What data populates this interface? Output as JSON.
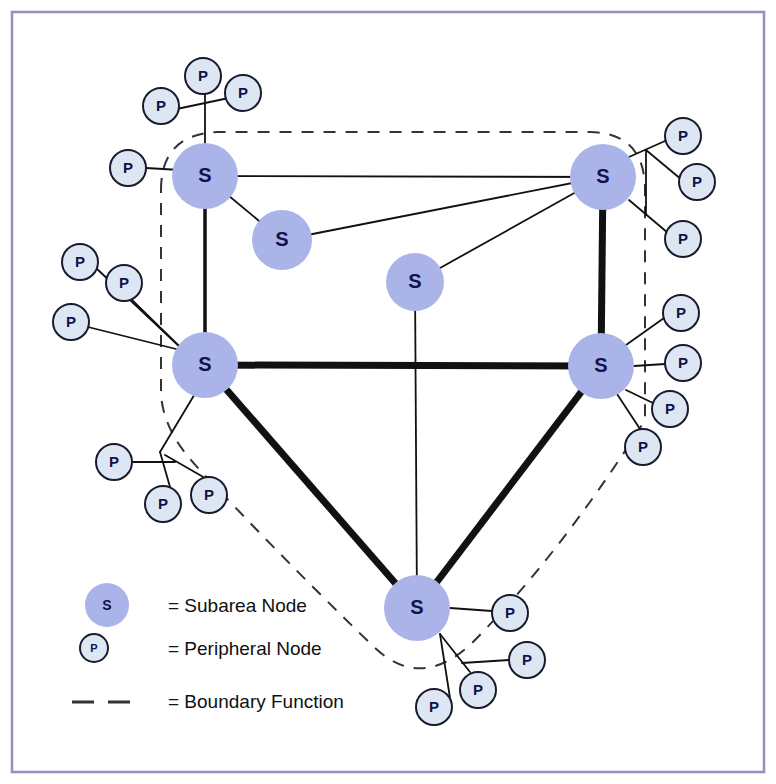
{
  "figure": {
    "kind": "network-topology-diagram",
    "background": "#ffffff",
    "frame": {
      "x": 12,
      "y": 12,
      "width": 752,
      "height": 760,
      "color": "#8f90c8",
      "stroke_width": 2.5
    }
  },
  "style": {
    "subarea_fill": "#aab4e8",
    "subarea_stroke": "none",
    "peripheral_fill": "#dde7f4",
    "peripheral_stroke": "#1a1a2e",
    "peripheral_stroke_width": 2,
    "backbone_link_color": "#111111",
    "backbone_link_width": 7,
    "trunk_link_color": "#111111",
    "trunk_link_width": 3.5,
    "thin_link_color": "#111111",
    "thin_link_width": 1.8,
    "boundary_color": "#333333",
    "boundary_width": 2,
    "boundary_dash": "12 10",
    "subarea_label_size": 20,
    "peripheral_label_size": 15
  },
  "subarea_nodes": [
    {
      "id": "s-top-left",
      "label": "S",
      "x": 205,
      "y": 176,
      "r": 33
    },
    {
      "id": "s-top-right",
      "label": "S",
      "x": 603,
      "y": 177,
      "r": 33
    },
    {
      "id": "s-mid-left",
      "label": "S",
      "x": 205,
      "y": 365,
      "r": 33
    },
    {
      "id": "s-mid-right",
      "label": "S",
      "x": 601,
      "y": 366,
      "r": 33
    },
    {
      "id": "s-bottom",
      "label": "S",
      "x": 417,
      "y": 608,
      "r": 33
    },
    {
      "id": "s-inner-upper",
      "label": "S",
      "x": 282,
      "y": 240,
      "r": 30
    },
    {
      "id": "s-inner-center",
      "label": "S",
      "x": 415,
      "y": 282,
      "r": 29
    }
  ],
  "peripheral_nodes": [
    {
      "id": "p-tl-1",
      "label": "P",
      "x": 203,
      "y": 76,
      "r": 18
    },
    {
      "id": "p-tl-2",
      "label": "P",
      "x": 161,
      "y": 106,
      "r": 18
    },
    {
      "id": "p-tl-3",
      "label": "P",
      "x": 243,
      "y": 93,
      "r": 18
    },
    {
      "id": "p-tl-4",
      "label": "P",
      "x": 128,
      "y": 168,
      "r": 18
    },
    {
      "id": "p-ml-1",
      "label": "P",
      "x": 80,
      "y": 262,
      "r": 18
    },
    {
      "id": "p-ml-2",
      "label": "P",
      "x": 124,
      "y": 283,
      "r": 18
    },
    {
      "id": "p-ml-3",
      "label": "P",
      "x": 71,
      "y": 322,
      "r": 18
    },
    {
      "id": "p-bl-1",
      "label": "P",
      "x": 114,
      "y": 462,
      "r": 18
    },
    {
      "id": "p-bl-2",
      "label": "P",
      "x": 163,
      "y": 504,
      "r": 18
    },
    {
      "id": "p-bl-3",
      "label": "P",
      "x": 209,
      "y": 495,
      "r": 18
    },
    {
      "id": "p-tr-1",
      "label": "P",
      "x": 683,
      "y": 136,
      "r": 18
    },
    {
      "id": "p-tr-2",
      "label": "P",
      "x": 697,
      "y": 182,
      "r": 18
    },
    {
      "id": "p-tr-3",
      "label": "P",
      "x": 683,
      "y": 239,
      "r": 18
    },
    {
      "id": "p-mr-1",
      "label": "P",
      "x": 681,
      "y": 313,
      "r": 18
    },
    {
      "id": "p-mr-2",
      "label": "P",
      "x": 683,
      "y": 363,
      "r": 18
    },
    {
      "id": "p-mr-3",
      "label": "P",
      "x": 670,
      "y": 409,
      "r": 18
    },
    {
      "id": "p-mr-4",
      "label": "P",
      "x": 643,
      "y": 447,
      "r": 18
    },
    {
      "id": "p-b-1",
      "label": "P",
      "x": 510,
      "y": 613,
      "r": 18
    },
    {
      "id": "p-b-2",
      "label": "P",
      "x": 527,
      "y": 660,
      "r": 18
    },
    {
      "id": "p-b-3",
      "label": "P",
      "x": 478,
      "y": 690,
      "r": 18
    },
    {
      "id": "p-b-4",
      "label": "P",
      "x": 434,
      "y": 707,
      "r": 18
    }
  ],
  "backbone_links": [
    {
      "id": "bb-midleft-midright",
      "from": "s-mid-left",
      "to": "s-mid-right"
    },
    {
      "id": "bb-topright-midright",
      "from": "s-top-right",
      "to": "s-mid-right"
    },
    {
      "id": "bb-midleft-bottom",
      "from": "s-mid-left",
      "to": "s-bottom"
    },
    {
      "id": "bb-midright-bottom",
      "from": "s-mid-right",
      "to": "s-bottom"
    }
  ],
  "trunk_links": [
    {
      "id": "tr-topleft-midleft",
      "from": "s-top-left",
      "to": "s-mid-left"
    }
  ],
  "thin_links": [
    {
      "id": "tn-topleft-topright",
      "from": "s-top-left",
      "to": "s-top-right"
    },
    {
      "id": "tn-topleft-innerupper",
      "from": "s-top-left",
      "to": "s-inner-upper"
    },
    {
      "id": "tn-innerupper-topright",
      "from": "s-inner-upper",
      "to": "s-top-right"
    },
    {
      "id": "tn-innercenter-topright",
      "from": "s-inner-center",
      "to": "s-top-right"
    },
    {
      "id": "tn-innercenter-bottom",
      "from": "s-inner-center",
      "to": "s-bottom"
    }
  ],
  "peripheral_links": [
    {
      "id": "pl-tl-stem",
      "points": "205,146 205,88"
    },
    {
      "id": "pl-tl-cross",
      "points": "172,110 243,95"
    },
    {
      "id": "pl-tl-4",
      "points": "146,168 180,170"
    },
    {
      "id": "pl-ml-fan-a",
      "points": "96,268 180,347"
    },
    {
      "id": "pl-ml-fan-b",
      "points": "131,299 180,347"
    },
    {
      "id": "pl-ml-fan-c",
      "points": "88,327 180,350"
    },
    {
      "id": "pl-bl-stem",
      "points": "196,392 160,452"
    },
    {
      "id": "pl-bl-1",
      "points": "132,462 175,462"
    },
    {
      "id": "pl-bl-2",
      "points": "170,487 163,487"
    },
    {
      "id": "pl-bl-3",
      "points": "165,455 205,478"
    },
    {
      "id": "pl-bl-4",
      "points": "160,452 170,487"
    },
    {
      "id": "pl-tr-stem",
      "points": "629,157 665,141"
    },
    {
      "id": "pl-tr-a",
      "points": "646,150 682,180"
    },
    {
      "id": "pl-tr-b",
      "points": "646,150 646,215"
    },
    {
      "id": "pl-tr-c",
      "points": "629,200 668,233"
    },
    {
      "id": "pl-mr-a",
      "points": "626,345 664,318"
    },
    {
      "id": "pl-mr-b",
      "points": "634,366 665,364"
    },
    {
      "id": "pl-mr-c",
      "points": "626,390 655,404"
    },
    {
      "id": "pl-mr-d",
      "points": "617,394 640,429"
    },
    {
      "id": "pl-b-a",
      "points": "450,608 492,611"
    },
    {
      "id": "pl-b-b",
      "points": "440,634 470,672"
    },
    {
      "id": "pl-b-c",
      "points": "440,634 450,698"
    },
    {
      "id": "pl-b-d",
      "points": "462,663 509,660"
    }
  ],
  "boundary": {
    "id": "boundary-function-outline",
    "path": "M 161 190 Q 161 134 218 132 L 590 132 Q 645 133 645 190 L 645 420 Q 560 555 470 645 Q 420 690 375 648 Q 280 556 200 470 Q 161 430 161 390 Z"
  },
  "legend": {
    "title": "",
    "items": [
      {
        "id": "legend-subarea",
        "symbol": "subarea-node-symbol",
        "text": "= Subarea Node",
        "symbol_x": 107,
        "symbol_y": 605,
        "symbol_r": 22,
        "symbol_label": "S",
        "text_x": 168,
        "text_y": 607
      },
      {
        "id": "legend-peripheral",
        "symbol": "peripheral-node-symbol",
        "text": "= Peripheral Node",
        "symbol_x": 94,
        "symbol_y": 648,
        "symbol_r": 14,
        "symbol_label": "P",
        "text_x": 168,
        "text_y": 650
      },
      {
        "id": "legend-boundary",
        "symbol": "boundary-dash-symbol",
        "text": "= Boundary Function",
        "dash_y": 702,
        "dash_x1": 72,
        "dash_x2": 135,
        "text_x": 168,
        "text_y": 703
      }
    ]
  }
}
